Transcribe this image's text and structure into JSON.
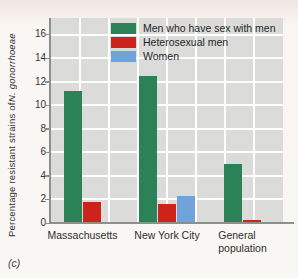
{
  "figure": {
    "panel_label": "(c)",
    "ylabel_main": "Percentage resistant strains of ",
    "ylabel_species": "N. gonorrhoeae"
  },
  "chart_data": {
    "type": "bar",
    "title": "",
    "categories": [
      "Massachusetts",
      "New York City",
      "General\npopulation"
    ],
    "series": [
      {
        "name": "Men who have sex with men",
        "color": "#2c8257",
        "values": [
          11.2,
          12.5,
          5.0
        ]
      },
      {
        "name": "Heterosexual men",
        "color": "#cc231c",
        "values": [
          1.8,
          1.6,
          0.3
        ]
      },
      {
        "name": "Women",
        "color": "#6fa3d9",
        "values": [
          null,
          2.3,
          null
        ]
      }
    ],
    "xlabel": "",
    "ylabel": "Percentage resistant strains of N. gonorrhoeae",
    "yticks": [
      0,
      2,
      4,
      6,
      8,
      10,
      12,
      14,
      16
    ],
    "ylim": [
      0,
      17.4
    ],
    "grid": true,
    "plot_background": "#dbdbd9",
    "gridline_color": "#ffffff",
    "legend_position": "top-inside"
  }
}
